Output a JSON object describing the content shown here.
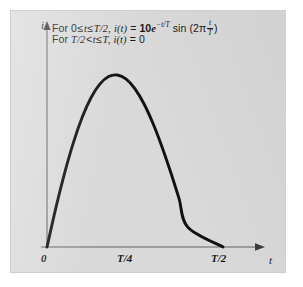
{
  "figure": {
    "background_color": "#d9d9d9",
    "page_color": "#ffffff",
    "ink_color": "#1a1a1a",
    "axis_color": "#808080"
  },
  "annotation": {
    "line1": {
      "prefix": "For 0",
      "rel1": "≤",
      "var_t1": "t",
      "rel2": "≤",
      "bound": "T/2,",
      "func": "i(t)",
      "equals": "=",
      "coefficient": "10",
      "base": "e",
      "exponent": "−t/T",
      "trig": "sin (2π",
      "frac_num": "t",
      "frac_den": "T",
      "close": ")"
    },
    "line2": {
      "prefix": "For",
      "bound1": "T/2",
      "rel1": "<",
      "var_t1": "t",
      "rel2": "≤",
      "bound2": "T,",
      "func": "i(t)",
      "equals": "=",
      "value": "0"
    },
    "line1_plain": "For 0 ≤ t ≤ T/2, i(t) = 10e⁻ᵗᐟᵀ sin (2π t/T)",
    "line2_plain": "For T/2 < t ≤ T, i(t) = 0"
  },
  "axes": {
    "y_label": "i",
    "x_label": "t",
    "x_ticks": [
      {
        "label": "0",
        "value": 0
      },
      {
        "label": "T/4",
        "value": 0.25
      },
      {
        "label": "T/2",
        "value": 0.5
      }
    ]
  },
  "chart_data": {
    "type": "line",
    "title": "",
    "xlabel": "t",
    "ylabel": "i",
    "grid": false,
    "legend": null,
    "xlim": [
      0,
      0.58
    ],
    "ylim": [
      0,
      8.2
    ],
    "x_tick_labels": [
      "0",
      "T/4",
      "T/2"
    ],
    "x_tick_values": [
      0,
      0.25,
      0.5
    ],
    "y_tick_labels": [],
    "annotations": [
      "For 0 ≤ t ≤ T/2, i(t) = 10e^(−t/T) sin (2π t/T)",
      "For T/2 < t ≤ T, i(t) = 0"
    ],
    "equation": "i(t) = 10*exp(-t/T)*sin(2*pi*t/T) for 0 <= t <= T/2 ; i(t) = 0 for T/2 < t <= T",
    "series": [
      {
        "name": "i(t)",
        "color": "#111111",
        "x": [
          0.0,
          0.025,
          0.05,
          0.075,
          0.1,
          0.125,
          0.15,
          0.175,
          0.2,
          0.225,
          0.25,
          0.275,
          0.3,
          0.325,
          0.35,
          0.375,
          0.4,
          0.425,
          0.45,
          0.475,
          0.5
        ],
        "y": [
          0.0,
          1.508,
          2.867,
          4.047,
          5.025,
          5.783,
          6.311,
          6.605,
          6.666,
          6.503,
          6.129,
          5.562,
          4.825,
          3.946,
          2.954,
          1.883,
          0.768,
          -0.355,
          -1.448,
          -2.475,
          -3.403
        ]
      }
    ]
  }
}
